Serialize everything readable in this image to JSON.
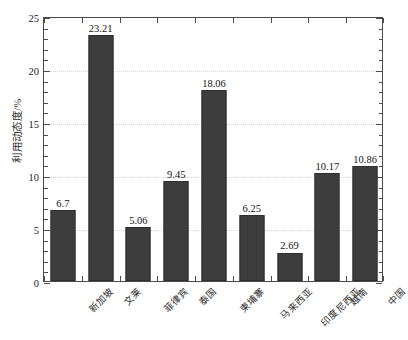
{
  "chart_data": {
    "type": "bar",
    "title": "",
    "subtitle": "",
    "xlabel": "",
    "ylabel": "利用动态度/%",
    "ylim": [
      0,
      25
    ],
    "yticks": [
      0,
      5,
      10,
      15,
      20,
      25
    ],
    "ytick_labels": [
      "0",
      "5",
      "10",
      "15",
      "20",
      "25"
    ],
    "grid": true,
    "grid_axis": "y",
    "legend": false,
    "legend_position": "none",
    "bar_color": "#3d3d3d",
    "categories": [
      "新加坡",
      "文莱",
      "菲律宾",
      "泰国",
      "柬埔寨",
      "马来西亚",
      "印度尼西亚",
      "越南",
      "中国"
    ],
    "values": [
      6.7,
      23.21,
      5.06,
      9.45,
      18.06,
      6.25,
      2.69,
      10.17,
      10.86
    ],
    "value_labels": [
      "6.7",
      "23.21",
      "5.06",
      "9.45",
      "18.06",
      "6.25",
      "2.69",
      "10.17",
      "10.86"
    ],
    "series": [
      {
        "name": "利用动态度",
        "values": [
          6.7,
          23.21,
          5.06,
          9.45,
          18.06,
          6.25,
          2.69,
          10.17,
          10.86
        ]
      }
    ],
    "axis": {
      "y_title": "利用动态度/%",
      "minor_ticks": true,
      "mirrored_right_axis": true,
      "frame": "box"
    }
  }
}
